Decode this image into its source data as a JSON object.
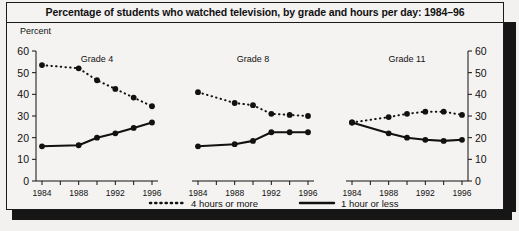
{
  "figure": {
    "title": "Percentage of students who watched television, by grade and hours per day: 1984–96",
    "y_axis_title": "Percent"
  },
  "legend": {
    "items": [
      {
        "label": "4 hours or more",
        "style": "dotted",
        "color": "#111111"
      },
      {
        "label": "1 hour or less",
        "style": "solid",
        "color": "#111111"
      }
    ]
  },
  "axis": {
    "y_ticks": [
      "60",
      "50",
      "40",
      "30",
      "20",
      "10",
      "0"
    ],
    "y_ticks_right": [
      "60",
      "50",
      "40",
      "30",
      "20",
      "10",
      "0"
    ],
    "x_tick_labels": [
      "1984",
      "1988",
      "1992",
      "1996"
    ]
  },
  "panels": [
    {
      "name": "Grade 4"
    },
    {
      "name": "Grade 8"
    },
    {
      "name": "Grade 11"
    }
  ],
  "chart_data": {
    "type": "line",
    "title": "Percentage of students who watched television, by grade and hours per day: 1984–96",
    "xlabel": "",
    "ylabel": "Percent",
    "ylim": [
      0,
      60
    ],
    "ytick_step": 10,
    "grid": false,
    "legend_position": "bottom",
    "x": [
      1984,
      1988,
      1990,
      1992,
      1994,
      1996
    ],
    "x_tick_labels": [
      "1984",
      "1988",
      "1992",
      "1996"
    ],
    "panels": [
      {
        "name": "Grade 4",
        "series": [
          {
            "name": "4 hours or more",
            "style": "dotted",
            "values": [
              53.5,
              52,
              46.5,
              42.5,
              38.5,
              34.5
            ]
          },
          {
            "name": "1 hour or less",
            "style": "solid",
            "values": [
              16,
              16.5,
              20,
              22,
              24.5,
              27
            ]
          }
        ]
      },
      {
        "name": "Grade 8",
        "series": [
          {
            "name": "4 hours or more",
            "style": "dotted",
            "values": [
              41,
              36,
              35,
              31,
              30.5,
              30
            ]
          },
          {
            "name": "1 hour or less",
            "style": "solid",
            "values": [
              16,
              17,
              18.5,
              22.5,
              22.5,
              22.5
            ]
          }
        ]
      },
      {
        "name": "Grade 11",
        "series": [
          {
            "name": "4 hours or more",
            "style": "dotted",
            "values": [
              27,
              29.5,
              31,
              32,
              32,
              30.5
            ]
          },
          {
            "name": "1 hour or less",
            "style": "solid",
            "values": [
              27,
              22,
              20,
              19,
              18.5,
              19
            ]
          }
        ]
      }
    ]
  }
}
